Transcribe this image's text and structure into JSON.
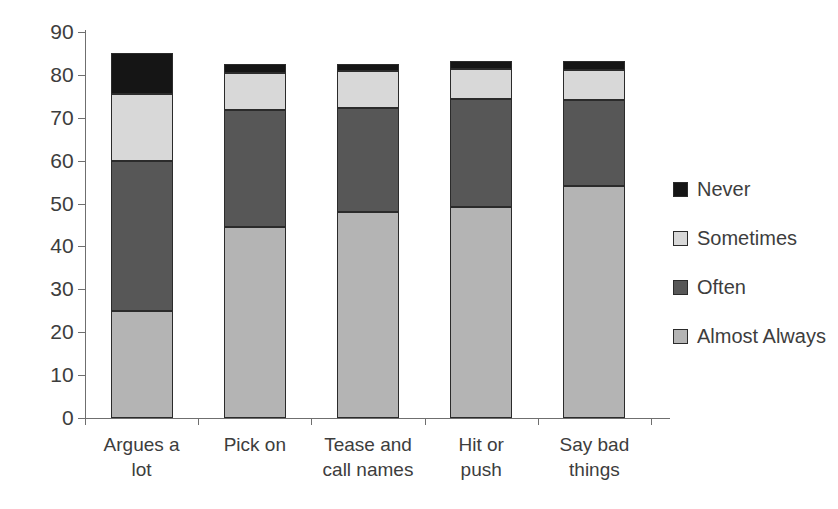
{
  "chart_data": {
    "type": "bar",
    "subtype": "stacked-vertical",
    "title": "",
    "subtitle": "",
    "xlabel": "",
    "ylabel": "",
    "ylim": [
      0,
      90
    ],
    "yticks": [
      0,
      10,
      20,
      30,
      40,
      50,
      60,
      70,
      80,
      90
    ],
    "ytick_labels": [
      "0",
      "10",
      "20",
      "30",
      "40",
      "50",
      "60",
      "70",
      "80",
      "90"
    ],
    "grid": false,
    "legend_position": "right",
    "categories": [
      "Argues a lot",
      "Pick on",
      "Tease and call names",
      "Hit or push",
      "Say bad things"
    ],
    "category_lines": [
      [
        "Argues a",
        "lot"
      ],
      [
        "Pick on",
        ""
      ],
      [
        "Tease and",
        "call names"
      ],
      [
        "Hit or",
        "push"
      ],
      [
        "Say bad",
        "things"
      ]
    ],
    "stack_order_bottom_to_top": [
      "Almost Always",
      "Often",
      "Sometimes",
      "Never"
    ],
    "series": [
      {
        "name": "Almost Always",
        "color": "#b4b4b4",
        "values": [
          25.0,
          44.5,
          48.0,
          49.3,
          54.2
        ]
      },
      {
        "name": "Often",
        "color": "#575757",
        "values": [
          35.0,
          27.3,
          24.3,
          25.0,
          20.0
        ]
      },
      {
        "name": "Sometimes",
        "color": "#d8d8d8",
        "values": [
          15.5,
          8.7,
          8.7,
          7.0,
          7.0
        ]
      },
      {
        "name": "Never",
        "color": "#151515",
        "values": [
          9.5,
          2.0,
          1.5,
          2.0,
          2.0
        ]
      }
    ],
    "totals": [
      85.0,
      82.5,
      82.5,
      83.3,
      83.2
    ]
  },
  "legend": {
    "items": [
      {
        "label": "Never",
        "swatch": "never"
      },
      {
        "label": "Sometimes",
        "swatch": "sometimes"
      },
      {
        "label": "Often",
        "swatch": "often"
      },
      {
        "label": "Almost Always",
        "swatch": "almost"
      }
    ]
  },
  "colors": {
    "never": "#151515",
    "sometimes": "#d8d8d8",
    "often": "#575757",
    "almost_always": "#b4b4b4",
    "axis": "#6f6f6f",
    "text": "#3d3d3d",
    "background": "#ffffff"
  }
}
